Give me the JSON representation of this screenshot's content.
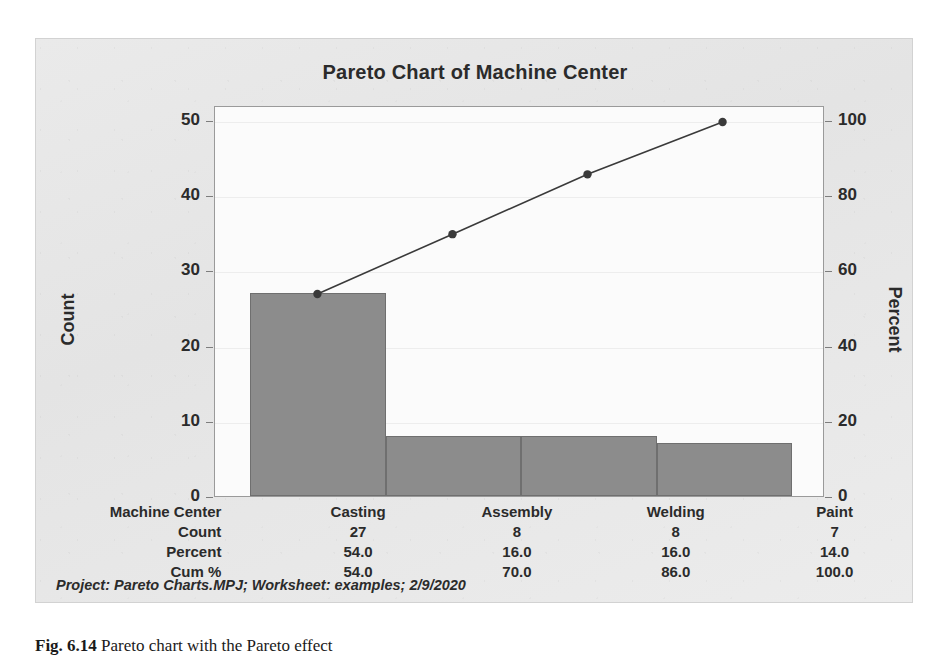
{
  "figure": {
    "title": "Pareto Chart of Machine Center",
    "footnote": "Project: Pareto Charts.MPJ; Worksheet: examples; 2/9/2020",
    "caption_label": "Fig. 6.14",
    "caption_text": "Pareto chart with the Pareto effect",
    "bar_color": "#8c8c8c",
    "bar_border_color": "#6f6f6f",
    "line_color": "#3a3a3a",
    "frame_color": "#9a9a9a",
    "panel_background": "#e8e8e8"
  },
  "chart_data": {
    "type": "bar",
    "title": "Pareto Chart of Machine Center",
    "xlabel": "Machine Center",
    "ylabel": "Count",
    "y2label": "Percent",
    "categories": [
      "Casting",
      "Assembly",
      "Welding",
      "Paint"
    ],
    "values": [
      27,
      8,
      8,
      7
    ],
    "percent": [
      54.0,
      16.0,
      16.0,
      14.0
    ],
    "cumulative_percent": [
      54.0,
      70.0,
      86.0,
      100.0
    ],
    "ylim": [
      0,
      52
    ],
    "y2lim": [
      0,
      104
    ],
    "yticks": [
      0,
      10,
      20,
      30,
      40,
      50
    ],
    "y2ticks": [
      0,
      20,
      40,
      60,
      80,
      100
    ],
    "grid": true,
    "legend": "none",
    "series": [
      {
        "name": "Count",
        "type": "bar",
        "values": [
          27,
          8,
          8,
          7
        ]
      },
      {
        "name": "Cum %",
        "type": "line",
        "values": [
          54.0,
          70.0,
          86.0,
          100.0
        ]
      }
    ]
  },
  "table": {
    "rows": [
      {
        "label": "Machine Center",
        "cells": [
          "Casting",
          "Assembly",
          "Welding",
          "Paint"
        ]
      },
      {
        "label": "Count",
        "cells": [
          "27",
          "8",
          "8",
          "7"
        ]
      },
      {
        "label": "Percent",
        "cells": [
          "54.0",
          "16.0",
          "16.0",
          "14.0"
        ]
      },
      {
        "label": "Cum %",
        "cells": [
          "54.0",
          "70.0",
          "86.0",
          "100.0"
        ]
      }
    ]
  },
  "axis_left": {
    "title": "Count",
    "ticks": [
      "50",
      "40",
      "30",
      "20",
      "10",
      "0"
    ]
  },
  "axis_right": {
    "title": "Percent",
    "ticks": [
      "100",
      "80",
      "60",
      "40",
      "20",
      "0"
    ]
  }
}
